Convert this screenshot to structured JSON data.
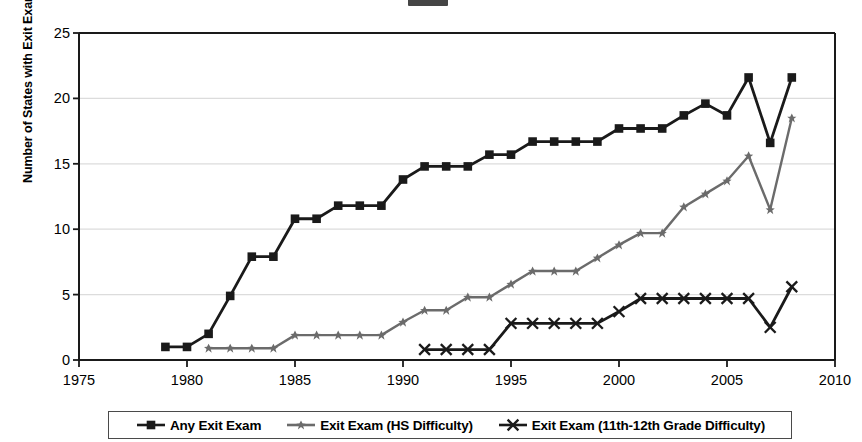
{
  "chart_data": {
    "type": "line",
    "title": "",
    "xlabel": "",
    "ylabel": "Number of States with Exit Exam",
    "xlim": [
      1975,
      2010
    ],
    "ylim": [
      0,
      25
    ],
    "xticks": [
      1975,
      1980,
      1985,
      1990,
      1995,
      2000,
      2005,
      2010
    ],
    "yticks": [
      0,
      5,
      10,
      15,
      20,
      25
    ],
    "grid": "horizontal",
    "legend_position": "bottom",
    "series": [
      {
        "name": "Any Exit Exam",
        "marker": "square",
        "color": "#1a1a1a",
        "x": [
          1979,
          1980,
          1981,
          1982,
          1983,
          1984,
          1985,
          1986,
          1987,
          1988,
          1989,
          1990,
          1991,
          1992,
          1993,
          1994,
          1995,
          1996,
          1997,
          1998,
          1999,
          2000,
          2001,
          2002,
          2003,
          2004,
          2005,
          2006,
          2007,
          2008
        ],
        "values": [
          1.0,
          1.0,
          2.0,
          4.9,
          7.9,
          7.9,
          10.8,
          10.8,
          11.8,
          11.8,
          11.8,
          13.8,
          14.8,
          14.8,
          14.8,
          15.7,
          15.7,
          16.7,
          16.7,
          16.7,
          16.7,
          17.7,
          17.7,
          17.7,
          18.7,
          19.6,
          18.7,
          21.6,
          16.6,
          21.6
        ]
      },
      {
        "name": "Exit Exam (HS Difficulty)",
        "marker": "star",
        "color": "#6b6b6b",
        "x": [
          1981,
          1982,
          1983,
          1984,
          1985,
          1986,
          1987,
          1988,
          1989,
          1990,
          1991,
          1992,
          1993,
          1994,
          1995,
          1996,
          1997,
          1998,
          1999,
          2000,
          2001,
          2002,
          2003,
          2004,
          2005,
          2006,
          2007,
          2008
        ],
        "values": [
          0.9,
          0.9,
          0.9,
          0.9,
          1.9,
          1.9,
          1.9,
          1.9,
          1.9,
          2.9,
          3.8,
          3.8,
          4.8,
          4.8,
          5.8,
          6.8,
          6.8,
          6.8,
          7.8,
          8.8,
          9.7,
          9.7,
          11.7,
          12.7,
          13.7,
          15.6,
          11.5,
          18.5
        ]
      },
      {
        "name": "Exit Exam (11th-12th Grade Difficulty)",
        "marker": "x",
        "color": "#1a1a1a",
        "x": [
          1991,
          1992,
          1993,
          1994,
          1995,
          1996,
          1997,
          1998,
          1999,
          2000,
          2001,
          2002,
          2003,
          2004,
          2005,
          2006,
          2007,
          2008
        ],
        "values": [
          0.8,
          0.8,
          0.8,
          0.8,
          2.8,
          2.8,
          2.8,
          2.8,
          2.8,
          3.7,
          4.7,
          4.7,
          4.7,
          4.7,
          4.7,
          4.7,
          2.5,
          5.6
        ]
      }
    ]
  },
  "legend": {
    "items": [
      {
        "label": "Any Exit Exam"
      },
      {
        "label": "Exit Exam (HS Difficulty)"
      },
      {
        "label": "Exit Exam (11th-12th Grade Difficulty)"
      }
    ]
  },
  "axis": {
    "y_label": "Number of States with Exit Exam",
    "y_ticks": [
      "25",
      "20",
      "15",
      "10",
      "5",
      "0"
    ],
    "x_ticks": [
      "1975",
      "1980",
      "1985",
      "1990",
      "1995",
      "2000",
      "2005",
      "2010"
    ]
  }
}
